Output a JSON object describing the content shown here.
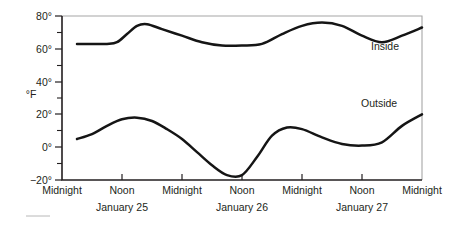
{
  "chart_data": {
    "type": "line",
    "title": "",
    "xlabel": "",
    "ylabel": "°F",
    "ylim": [
      -20,
      80
    ],
    "xlim": [
      0,
      72
    ],
    "grid": false,
    "legend_position": "inline-right",
    "y_ticks": [
      "80°",
      "60°",
      "40°",
      "20°",
      "0°",
      "−20°"
    ],
    "y_tick_values": [
      80,
      60,
      40,
      20,
      0,
      -20
    ],
    "y_minor_ticks": [
      70,
      50,
      30,
      10,
      -10
    ],
    "x_ticks": [
      "Midnight",
      "Noon",
      "Midnight",
      "Noon",
      "Midnight",
      "Noon",
      "Midnight"
    ],
    "x_tick_hours": [
      0,
      12,
      24,
      36,
      48,
      60,
      72
    ],
    "date_labels": [
      "January 25",
      "January 26",
      "January 27"
    ],
    "date_label_hours": [
      12,
      36,
      60
    ],
    "series": [
      {
        "name": "Inside",
        "label": "Inside",
        "color": "#151515",
        "x": [
          3,
          6,
          9,
          11,
          13,
          15,
          17,
          20,
          24,
          28,
          32,
          36,
          40,
          44,
          48,
          52,
          56,
          60,
          64,
          68,
          72
        ],
        "values": [
          63,
          63,
          63,
          64,
          69,
          74,
          75,
          72,
          68,
          64,
          62,
          62,
          63,
          69,
          74,
          76,
          74,
          68,
          64,
          68,
          73
        ]
      },
      {
        "name": "Outside",
        "label": "Outside",
        "color": "#151515",
        "x": [
          3,
          6,
          9,
          12,
          15,
          18,
          21,
          24,
          27,
          30,
          33,
          36,
          39,
          42,
          45,
          48,
          52,
          56,
          60,
          64,
          68,
          72
        ],
        "values": [
          5,
          8,
          13,
          17,
          18,
          16,
          11,
          5,
          -3,
          -11,
          -17,
          -17,
          -6,
          7,
          12,
          11,
          6,
          2,
          1,
          3,
          13,
          20
        ]
      }
    ]
  },
  "labels": {
    "y_axis_title": "°F",
    "inside_label": "Inside",
    "outside_label": "Outside"
  }
}
